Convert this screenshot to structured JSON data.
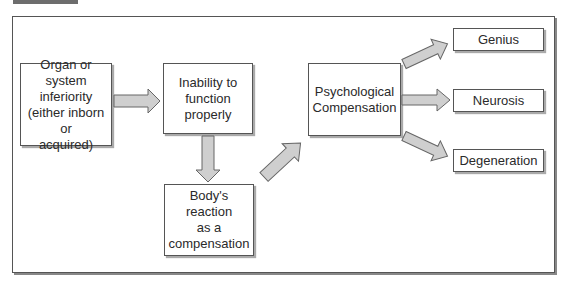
{
  "diagram": {
    "nodes": [
      {
        "id": "organ",
        "label": "Organ or system\ninferiority\n(either inborn or\nacquired)"
      },
      {
        "id": "inability",
        "label": "Inability to\nfunction\nproperly"
      },
      {
        "id": "body",
        "label": "Body's reaction\nas a\ncompensation"
      },
      {
        "id": "psych",
        "label": "Psychological\nCompensation"
      },
      {
        "id": "genius",
        "label": "Genius"
      },
      {
        "id": "neurosis",
        "label": "Neurosis"
      },
      {
        "id": "degeneration",
        "label": "Degeneration"
      }
    ],
    "edges": [
      {
        "from": "organ",
        "to": "inability"
      },
      {
        "from": "inability",
        "to": "body"
      },
      {
        "from": "body",
        "to": "psych"
      },
      {
        "from": "psych",
        "to": "genius"
      },
      {
        "from": "psych",
        "to": "neurosis"
      },
      {
        "from": "psych",
        "to": "degeneration"
      }
    ],
    "colors": {
      "arrow_fill": "#cfcfcf",
      "border": "#555555",
      "tab": "#6d6d6d"
    }
  }
}
